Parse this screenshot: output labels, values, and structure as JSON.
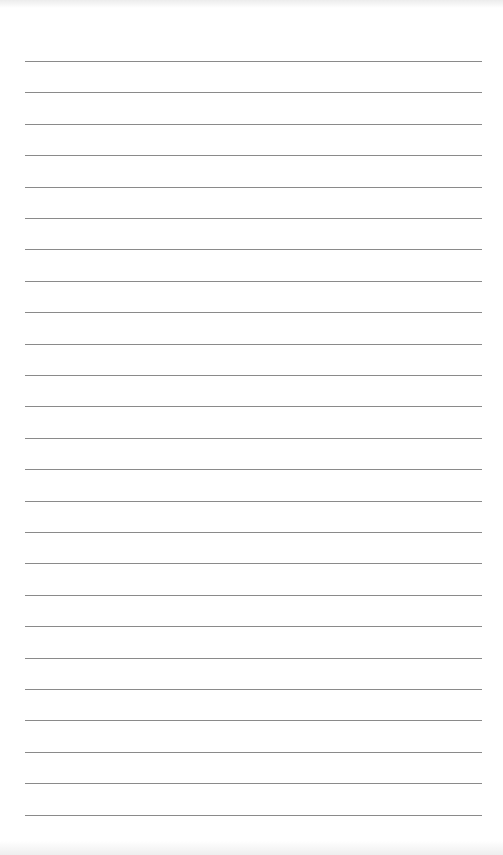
{
  "page": {
    "type": "lined-paper",
    "background_color": "#ffffff",
    "rule_color": "#8a8a8a",
    "rule_count": 25,
    "rule_left_px": 25,
    "rule_right_px": 482,
    "first_rule_y_px": 61,
    "rule_spacing_px": 31.4,
    "lines": [
      "",
      "",
      "",
      "",
      "",
      "",
      "",
      "",
      "",
      "",
      "",
      "",
      "",
      "",
      "",
      "",
      "",
      "",
      "",
      "",
      "",
      "",
      "",
      "",
      ""
    ]
  }
}
